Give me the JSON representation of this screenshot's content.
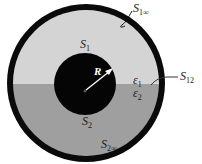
{
  "diagram": {
    "colors": {
      "outer_ring": "#0a0a0a",
      "region_upper": "#d4d4d4",
      "region_lower": "#9f9f9f",
      "inner_disk": "#050505",
      "radius_arrow": "#ffffff",
      "background": "#ffffff"
    },
    "labels": {
      "S1": {
        "main": "S",
        "sub": "1"
      },
      "S2": {
        "main": "S",
        "sub": "2"
      },
      "S1inf": {
        "main": "S",
        "sub": "1∞"
      },
      "S2inf": {
        "main": "S",
        "sub": "2∞"
      },
      "S12": {
        "main": "S",
        "sub": "12"
      },
      "eps1": {
        "main": "ε",
        "sub": "1"
      },
      "eps2": {
        "main": "ε",
        "sub": "2"
      },
      "R": "R"
    }
  }
}
